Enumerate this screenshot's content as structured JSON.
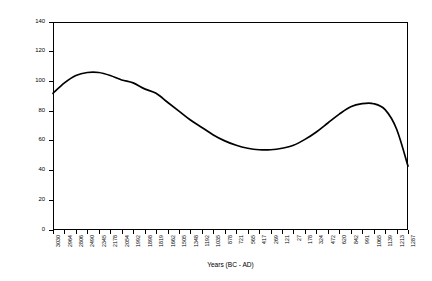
{
  "chart_data": {
    "type": "line",
    "title": "",
    "xlabel": "Years (BC - AD)",
    "ylabel": "Arboreal/Non-Arboreal Pollen %",
    "ylim": [
      0,
      140
    ],
    "ytick_values": [
      0,
      20,
      40,
      60,
      80,
      100,
      120,
      140
    ],
    "ytick_labels": [
      "0",
      "20",
      "40",
      "60",
      "80",
      "100",
      "120",
      "140"
    ],
    "grid": false,
    "legend": null,
    "xtick_labels": [
      "3030",
      "2964",
      "2806",
      "2490",
      "2345",
      "2178",
      "2054",
      "1992",
      "1898",
      "1819",
      "1662",
      "1505",
      "1348",
      "1192",
      "1035",
      "878",
      "721",
      "565",
      "417",
      "269",
      "121",
      "27",
      "178",
      "324",
      "472",
      "620",
      "842",
      "991",
      "1065",
      "1139",
      "1213",
      "1287"
    ],
    "x": [
      "3030",
      "2964",
      "2806",
      "2490",
      "2345",
      "2178",
      "2054",
      "1992",
      "1898",
      "1819",
      "1662",
      "1505",
      "1348",
      "1192",
      "1035",
      "878",
      "721",
      "565",
      "417",
      "269",
      "121",
      "27",
      "178",
      "324",
      "472",
      "620",
      "842",
      "991",
      "1065",
      "1139",
      "1213",
      "1287"
    ],
    "values": [
      92,
      99,
      104,
      106,
      106,
      104,
      101,
      99,
      95,
      92,
      86,
      80,
      74,
      69,
      64,
      60,
      57,
      55,
      54,
      54,
      55,
      57,
      61,
      66,
      72,
      78,
      83,
      85,
      85,
      81,
      68,
      43
    ],
    "series": [
      {
        "name": "Arboreal/Non-Arboreal Pollen %",
        "color": "#000000",
        "values": [
          92,
          99,
          104,
          106,
          106,
          104,
          101,
          99,
          95,
          92,
          86,
          80,
          74,
          69,
          64,
          60,
          57,
          55,
          54,
          54,
          55,
          57,
          61,
          66,
          72,
          78,
          83,
          85,
          85,
          81,
          68,
          43
        ]
      }
    ],
    "annotations": []
  }
}
